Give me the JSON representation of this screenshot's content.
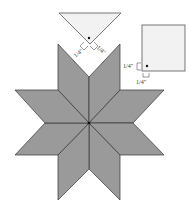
{
  "diagram": {
    "colors": {
      "star_fill": "#9a9a9a",
      "star_stroke": "#333333",
      "piece_fill": "#f2f2f2",
      "piece_stroke": "#555555",
      "dot": "#111111"
    },
    "star": {
      "center": [
        89,
        123
      ],
      "diamonds": [
        "89,123 89,77 58,44 58,90",
        "89,123 89,77 120,44 120,90",
        "89,123 120,90 164,90 133,123",
        "89,123 133,123 164,155 120,155",
        "89,123 120,155 120,200 89,169",
        "89,123 89,169 58,200 58,155",
        "89,123 58,155 15,155 45,123",
        "89,123 45,123 15,90 58,90"
      ]
    },
    "triangle": {
      "points": "59,13 121,13 90,44",
      "dot": [
        89,
        38
      ],
      "labels": [
        {
          "text": "1/4\"",
          "x": 72,
          "y": 56,
          "rotate": -45
        },
        {
          "text": "1/4\"",
          "x": 97,
          "y": 50,
          "rotate": 45
        }
      ]
    },
    "square": {
      "x": 142,
      "y": 25,
      "width": 43,
      "height": 46,
      "dot": [
        147,
        66
      ],
      "labels": [
        {
          "text": "1/4\"",
          "x": 124,
          "y": 67
        },
        {
          "text": "1/4\"",
          "x": 136,
          "y": 84
        }
      ]
    }
  }
}
